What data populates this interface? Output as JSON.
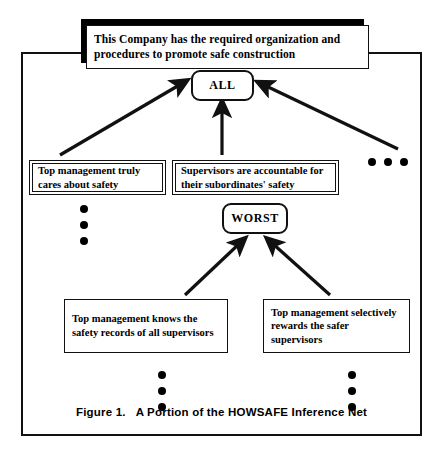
{
  "figure": {
    "caption_number": "Figure 1.",
    "caption_title": "A Portion of the HOWSAFE Inference Net",
    "frame_color": "#111111",
    "background": "#ffffff"
  },
  "banner": {
    "text": "This Company has the required organization and procedures to promote safe construction",
    "shadow_color": "#000000",
    "fill_color": "#ffffff"
  },
  "nodes": [
    {
      "id": "all",
      "label": "ALL",
      "shape": "rounded-rect"
    },
    {
      "id": "worst",
      "label": "WORST",
      "shape": "rounded-rect"
    }
  ],
  "evidence_boxes": [
    {
      "id": "top-management-cares",
      "text": "Top management truly cares about safety",
      "border": "double"
    },
    {
      "id": "supervisors-accountable",
      "text": "Supervisors are accountable for their subordinates' safety",
      "border": "double"
    },
    {
      "id": "knows-safety-records",
      "text": "Top management knows the safety records of all supervisors",
      "border": "single"
    },
    {
      "id": "selectively-rewards",
      "text": "Top management selectively rewards the safer supervisors",
      "border": "single"
    }
  ],
  "ellipses": [
    {
      "id": "right-of-supervisors-box",
      "orientation": "horizontal",
      "count": 3
    },
    {
      "id": "below-top-management-cares",
      "orientation": "vertical",
      "count": 3
    },
    {
      "id": "below-knows-safety-records",
      "orientation": "vertical",
      "count": 3
    },
    {
      "id": "below-selectively-rewards",
      "orientation": "vertical",
      "count": 3
    }
  ],
  "arrows": [
    {
      "id": "cares-to-all",
      "from": "top-management-cares",
      "to": "all",
      "style": "diagonal"
    },
    {
      "id": "accountable-to-all",
      "from": "supervisors-accountable",
      "to": "all",
      "style": "vertical"
    },
    {
      "id": "right-evidence-to-all",
      "from": "right-ellipsis-branch",
      "to": "all",
      "style": "diagonal"
    },
    {
      "id": "knows-records-to-worst",
      "from": "knows-safety-records",
      "to": "worst",
      "style": "diagonal"
    },
    {
      "id": "rewards-to-worst",
      "from": "selectively-rewards",
      "to": "worst",
      "style": "diagonal"
    }
  ]
}
